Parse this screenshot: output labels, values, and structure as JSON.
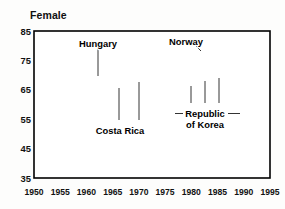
{
  "chart_data": {
    "type": "line",
    "title": "Female",
    "xlabel": "",
    "ylabel": "",
    "xlim": [
      1950,
      1995
    ],
    "ylim": [
      35,
      85
    ],
    "grid": true,
    "legend_position": "inline-annotations",
    "x_ticks": [
      "1950",
      "1955",
      "1960",
      "1965",
      "1970",
      "1975",
      "1980",
      "1985",
      "1990",
      "1995"
    ],
    "y_ticks": [
      "35",
      "45",
      "55",
      "65",
      "75",
      "85"
    ],
    "x": [
      1953,
      1955,
      1960,
      1965,
      1970,
      1975,
      1980,
      1985,
      1990,
      1993
    ],
    "series": [
      {
        "name": "Norway",
        "values": [
          75.0,
          75.1,
          75.4,
          76.3,
          77.3,
          78.1,
          79.2,
          79.7,
          80.4,
          81.0
        ],
        "line_weight": "thickest",
        "label_x": 1978.5,
        "label_y": 83.0
      },
      {
        "name": "Hungary",
        "values": [
          66.0,
          66.8,
          69.2,
          71.1,
          72.3,
          72.6,
          72.8,
          73.2,
          73.7,
          74.0
        ],
        "line_weight": "thick",
        "label_x": 1963.0,
        "label_y": 82.5
      },
      {
        "name": "Costa Rica",
        "values": [
          57.8,
          59.5,
          62.3,
          65.1,
          67.8,
          70.4,
          72.4,
          74.3,
          75.8,
          76.5
        ],
        "line_weight": "medium",
        "label_x": 1965.0,
        "label_y": 51.0
      },
      {
        "name": "Republic of Korea",
        "values": [
          47.0,
          50.3,
          55.0,
          58.2,
          61.0,
          63.8,
          66.6,
          69.3,
          73.3,
          75.6
        ],
        "line_weight": "thin",
        "label_x": 1982.0,
        "label_y": 55.5
      }
    ],
    "annotations": [
      {
        "text": "Hungary",
        "line_1": "Hungary",
        "line_2": ""
      },
      {
        "text": "Norway",
        "line_1": "Norway",
        "line_2": ""
      },
      {
        "text": "Costa Rica",
        "line_1": "Costa Rica",
        "line_2": ""
      },
      {
        "text": "Republic of Korea",
        "line_1": "Republic",
        "line_2": "of Korea"
      }
    ]
  },
  "labels": {
    "title": "Female",
    "hungary": "Hungary",
    "norway": "Norway",
    "costa_rica": "Costa Rica",
    "korea_line1": "Republic",
    "korea_line2": "of Korea"
  },
  "y_axis": {
    "t0": "35",
    "t1": "45",
    "t2": "55",
    "t3": "65",
    "t4": "75",
    "t5": "85"
  },
  "x_axis": {
    "t0": "1950",
    "t1": "1955",
    "t2": "1960",
    "t3": "1965",
    "t4": "1970",
    "t5": "1975",
    "t6": "1980",
    "t7": "1985",
    "t8": "1990",
    "t9": "1995"
  },
  "colors": {
    "line": "#000000",
    "grid": "#7c7c7c",
    "frame": "#000000",
    "background": "#fdfdfc",
    "text": "#111111"
  }
}
